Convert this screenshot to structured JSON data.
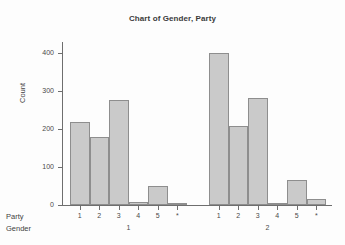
{
  "chart": {
    "title": "Chart of Gender, Party",
    "ylabel": "Count",
    "row_headers": {
      "party": "Party",
      "gender": "Gender"
    }
  },
  "chart_data": {
    "type": "bar",
    "title": "Chart of Gender, Party",
    "xlabel": "",
    "ylabel": "Count",
    "ylim": [
      0,
      430
    ],
    "yticks": [
      0,
      100,
      200,
      300,
      400
    ],
    "ytick_labels": [
      "0",
      "100",
      "200",
      "300",
      "400"
    ],
    "grid": false,
    "legend": null,
    "group_variable": "Gender",
    "category_variable": "Party",
    "groups": [
      {
        "group_label": "1",
        "categories": [
          "1",
          "2",
          "3",
          "4",
          "5",
          "*"
        ],
        "values": [
          218,
          180,
          278,
          8,
          51,
          3
        ]
      },
      {
        "group_label": "2",
        "categories": [
          "1",
          "2",
          "3",
          "4",
          "5",
          "*"
        ],
        "values": [
          401,
          208,
          282,
          5,
          65,
          17
        ]
      }
    ],
    "bar_color": "#cacaca",
    "bar_edge_color": "#8e8e8e"
  }
}
